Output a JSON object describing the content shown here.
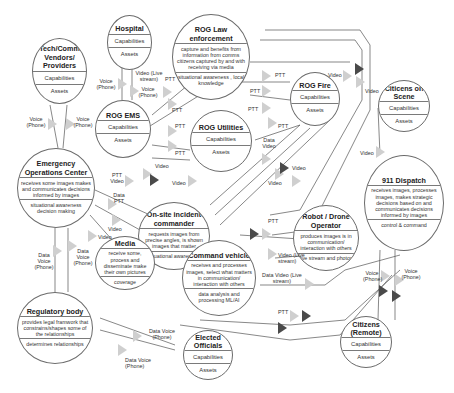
{
  "nodes": {
    "hospital": {
      "title": "Hospital",
      "capabilities": "Capabilities",
      "assets": "Assets"
    },
    "tech_comm": {
      "title": "Tech/Comm Vendors/ Providers",
      "capabilities": "Capabilities",
      "assets": "Assets"
    },
    "rog_law": {
      "title": "ROG Law enforcement",
      "capabilities": "capture and benefits from information from comms citizens captured by and with receiving via media",
      "assets": "situational awareness , local knowledge"
    },
    "rog_fire": {
      "title": "ROG Fire",
      "capabilities": "Capabilities",
      "assets": "Assets"
    },
    "citizens_scene": {
      "title": "Citicens on Scene",
      "capabilities": "Capabilities",
      "assets": "Assets"
    },
    "rog_ems": {
      "title": "ROG EMS",
      "capabilities": "Capabilities",
      "assets": "Assets"
    },
    "rog_utilities": {
      "title": "ROG Utilities",
      "capabilities": "Capabilities",
      "assets": "Assets"
    },
    "eoc": {
      "title": "Emergency Operations Center",
      "capabilities": "receives some images makes and communicates decisions informed by images",
      "assets": "situational awareness decision making"
    },
    "onsite": {
      "title": "On-site incident commander",
      "capabilities": "requests images from precise angles, is shown images that matter",
      "assets": "situational awareness"
    },
    "media": {
      "title": "Media",
      "capabilities": "receive some, process and disseminate make their own pictures",
      "assets": "coverage"
    },
    "command_vehicle": {
      "title": "Command vehicle",
      "capabilities": "receives and processes images, select what matters in communication/ interaction with others",
      "assets": "data analysis and processing ML/AI"
    },
    "robot": {
      "title": "Robot / Drone Operator",
      "capabilities": "produces images is in communication/ interaction with others",
      "assets": "live stream and photos"
    },
    "dispatch": {
      "title": "911 Dispatch",
      "capabilities": "receives images, processes images, makes strategic decisions based on and communicates decisions informed by images",
      "assets": "control & command"
    },
    "regulatory": {
      "title": "Regulatory body",
      "capabilities": "provides legal framwork that constrains/shapes some of the relationships",
      "assets": "determines relationships"
    },
    "elected": {
      "title": "Elected Officials",
      "capabilities": "Capabilities",
      "assets": "Assets"
    },
    "citizens_remote": {
      "title": "Citizens (Remote)",
      "capabilities": "Capabilities",
      "assets": "Assets"
    }
  },
  "edge_labels": {
    "hosp_voice": "Voice (Phone)",
    "hosp_video": "Video (Live stream)",
    "hosp_voice2": "Voice (Phone)",
    "tech_voice1": "Voice (Phone)",
    "tech_voice2": "Voice (Phone)",
    "ems_ptt1": "PTT",
    "ems_ptt2": "PTT",
    "ems_ptt3": "PTT",
    "ems_ptt4": "PTT",
    "law_ptt1": "PTT",
    "law_ptt2": "PTT",
    "util_ptt1": "PTT",
    "util_ptt2": "PTT",
    "fire_video": "Video",
    "scene_video1": "Video",
    "scene_video2": "Video",
    "data_video": "Data Video",
    "video_a": "Video",
    "video_b": "Video",
    "video_c": "Video",
    "video_d": "Video",
    "eoc_ptt_video": "PTT Video",
    "eoc_video": "Video",
    "eoc_data_ptt": "Data PTT",
    "eoc_video2": "Video",
    "eoc_data_voice1": "Data Voice (Phone)",
    "eoc_data_voice2": "Data Voice (Phone)",
    "onsite_ptt": "PTT",
    "robot_video": "Video (Live stream)",
    "robot_data_video": "Data Video (Live stream)",
    "cmd_ptt": "PTT",
    "dispatch_voice1": "Voice (Phone)",
    "dispatch_voice2": "Voice (Phone)",
    "reg_data_voice1": "Data Voice (Phone)",
    "reg_data_voice2": "Data Voice (Phone)"
  }
}
